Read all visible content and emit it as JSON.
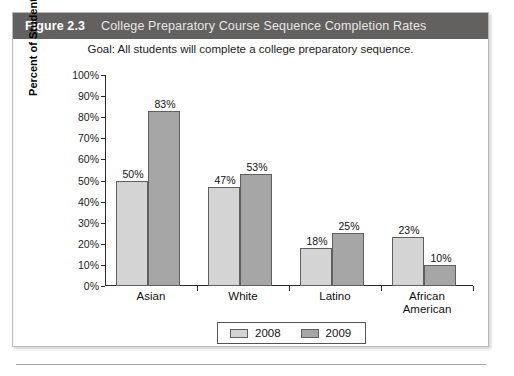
{
  "figure": {
    "number": "Figure 2.3",
    "title": "College Preparatory Course Sequence Completion Rates",
    "goal": "Goal: All students will complete a college preparatory sequence.",
    "header_bg": "#63615f"
  },
  "chart_data": {
    "type": "bar",
    "title": "College Preparatory Course Sequence Completion Rates",
    "subtitle": "Goal: All students will complete a college preparatory sequence.",
    "xlabel": "",
    "ylabel": "Percent of Students",
    "ylim": [
      0,
      100
    ],
    "ytick_labels": [
      "0%",
      "10%",
      "20%",
      "30%",
      "40%",
      "50%",
      "60%",
      "70%",
      "80%",
      "90%",
      "100%"
    ],
    "ytick_values": [
      0,
      10,
      20,
      30,
      40,
      50,
      60,
      70,
      80,
      90,
      100
    ],
    "grid": false,
    "legend_position": "bottom",
    "categories": [
      "Asian",
      "White",
      "Latino",
      "African American"
    ],
    "series": [
      {
        "name": "2008",
        "color": "#d4d4d4",
        "values": [
          50,
          47,
          18,
          23
        ],
        "labels": [
          "50%",
          "47%",
          "18%",
          "23%"
        ]
      },
      {
        "name": "2009",
        "color": "#a6a6a6",
        "values": [
          83,
          53,
          25,
          10
        ],
        "labels": [
          "83%",
          "53%",
          "25%",
          "10%"
        ]
      }
    ]
  },
  "category_lines": [
    [
      "Asian"
    ],
    [
      "White"
    ],
    [
      "Latino"
    ],
    [
      "African",
      "American"
    ]
  ]
}
